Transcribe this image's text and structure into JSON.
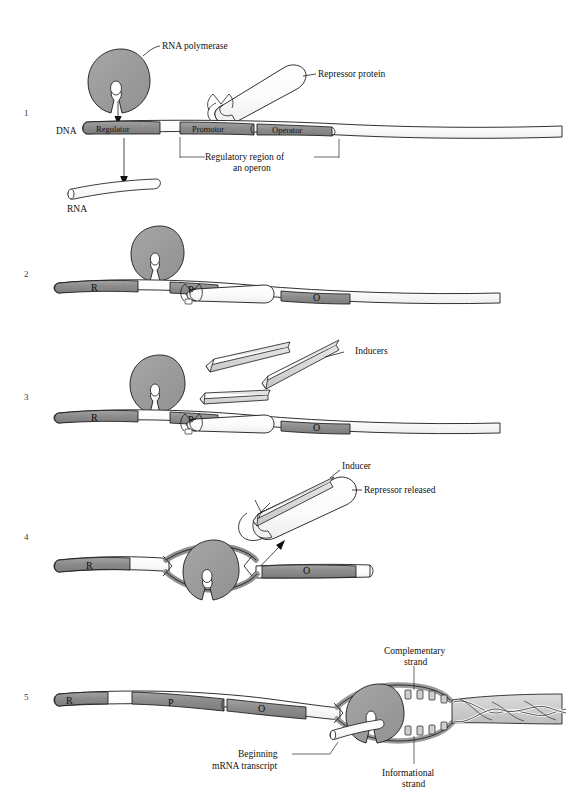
{
  "figure": {
    "title_alt": "Operon regulation: repressor, inducer and transcription",
    "colors": {
      "dna_segment_gray": "#8c8c8c",
      "dna_backbone_white": "#ffffff",
      "polymerase_gray": "#9a9a9a",
      "repressor_white": "#fbfbfb",
      "inducer_gray": "#d8d8d8",
      "outline": "#1a1a1a",
      "text": "#111111",
      "helix_gray": "#c9c9c9"
    }
  },
  "panels": [
    {
      "number": "1",
      "labels": {
        "polymerase": "RNA polymerase",
        "repressor": "Repressor protein",
        "dna": "DNA",
        "rna": "RNA",
        "regulatory_region_line1": "Regulatory region of",
        "regulatory_region_line2": "an operon"
      },
      "segments": [
        {
          "id": "regulator",
          "label": "Regulator"
        },
        {
          "id": "promotor",
          "label": "Promotor"
        },
        {
          "id": "operator",
          "label": "Operator"
        }
      ]
    },
    {
      "number": "2",
      "labels": {},
      "segments": [
        {
          "id": "regulator",
          "label": "R"
        },
        {
          "id": "promotor",
          "label": "P"
        },
        {
          "id": "operator",
          "label": "O"
        }
      ]
    },
    {
      "number": "3",
      "labels": {
        "inducers": "Inducers"
      },
      "segments": [
        {
          "id": "regulator",
          "label": "R"
        },
        {
          "id": "promotor",
          "label": "P"
        },
        {
          "id": "operator",
          "label": "O"
        }
      ]
    },
    {
      "number": "4",
      "labels": {
        "inducer": "Inducer",
        "repressor_released": "Repressor released"
      },
      "segments": [
        {
          "id": "regulator",
          "label": "R"
        },
        {
          "id": "operator",
          "label": "O"
        }
      ]
    },
    {
      "number": "5",
      "labels": {
        "complementary_line1": "Complementary",
        "complementary_line2": "strand",
        "informational_line1": "Informational",
        "informational_line2": "strand",
        "transcript_line1": "Beginning",
        "transcript_line2": "mRNA transcript"
      },
      "segments": [
        {
          "id": "regulator",
          "label": "R"
        },
        {
          "id": "promotor",
          "label": "P"
        },
        {
          "id": "operator",
          "label": "O"
        }
      ]
    }
  ]
}
